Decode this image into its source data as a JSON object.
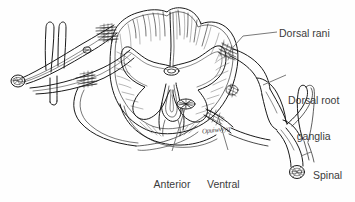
{
  "figure": {
    "background_color": "#fefefe",
    "ink_color": "#1a1a1a",
    "label_color": "#3b3b3b",
    "leader_color": "#555555",
    "labels": [
      {
        "id": "dorsal-rani",
        "text": "Dorsal rani",
        "lines": [
          "Dorsal rani"
        ]
      },
      {
        "id": "dorsal-root-ganglia",
        "text": "Dorsal root ganglia",
        "lines": [
          "Dorsal root",
          "ganglia"
        ]
      },
      {
        "id": "spinal-nerve",
        "text": "Spinal nerve",
        "lines": [
          "Spinal",
          "nerve"
        ]
      },
      {
        "id": "anterior-horn-cells",
        "text": "Anterior horn cells",
        "lines": [
          "Anterior",
          "horn",
          "cells"
        ]
      },
      {
        "id": "ventral-rani",
        "text": "Ventral rani",
        "lines": [
          "Ventral",
          "rani"
        ]
      }
    ],
    "label_text": {
      "dorsal_rani": "Dorsal rani",
      "dorsal_root_line1": "Dorsal root",
      "dorsal_root_line2": "ganglia",
      "spinal_nerve_line1": "Spinal",
      "spinal_nerve_line2": "nerve",
      "anterior_line1": "Anterior",
      "anterior_line2": "horn",
      "anterior_line3": "cells",
      "ventral_line1": "Ventral",
      "ventral_line2": "rani"
    },
    "annotation_scribble": "Opuiwvyyg"
  }
}
